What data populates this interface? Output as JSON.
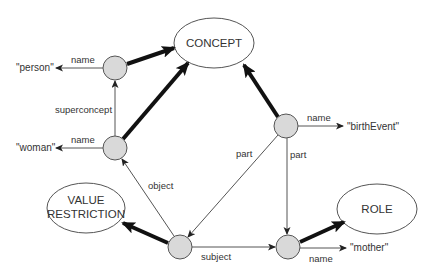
{
  "diagram": {
    "classes": [
      {
        "id": "concept",
        "label": "CONCEPT",
        "cx": 214,
        "cy": 43,
        "rx": 40,
        "ry": 25
      },
      {
        "id": "value-restriction",
        "label_lines": [
          "VALUE",
          "RESTRICTION"
        ],
        "cx": 86,
        "cy": 208,
        "rx": 39,
        "ry": 25
      },
      {
        "id": "role",
        "label": "ROLE",
        "cx": 377,
        "cy": 209,
        "rx": 40,
        "ry": 25
      }
    ],
    "instances": [
      {
        "id": "n-person",
        "cx": 115,
        "cy": 68
      },
      {
        "id": "n-woman",
        "cx": 115,
        "cy": 148
      },
      {
        "id": "n-birthevent",
        "cx": 286,
        "cy": 126
      },
      {
        "id": "n-restriction",
        "cx": 180,
        "cy": 247
      },
      {
        "id": "n-mother",
        "cx": 288,
        "cy": 247
      }
    ],
    "literals": {
      "person": "\"person\"",
      "woman": "\"woman\"",
      "birthEvent": "\"birthEvent\"",
      "mother": "\"mother\""
    },
    "edge_labels": {
      "name_person": "name",
      "name_woman": "name",
      "superconcept": "superconcept",
      "name_birthevent": "name",
      "part_left": "part",
      "part_right": "part",
      "object": "object",
      "subject": "subject",
      "name_mother": "name"
    },
    "colors": {
      "node_fill": "#d9d9d9",
      "stroke": "#555555",
      "thick_edge": "#111111",
      "text": "#333333"
    }
  }
}
